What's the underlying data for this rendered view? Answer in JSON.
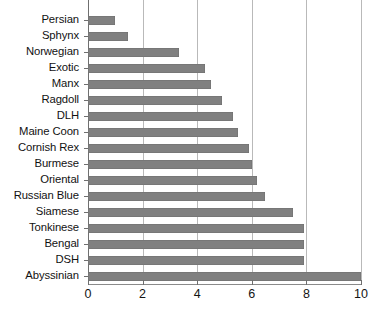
{
  "chart_data": {
    "type": "bar",
    "orientation": "horizontal",
    "title": "",
    "subtitle": "",
    "xlabel": "",
    "ylabel": "",
    "xlim": [
      0,
      10
    ],
    "ylim": null,
    "grid": true,
    "grid_axis": "x",
    "legend": false,
    "legend_position": "none",
    "bar_color": "#808080",
    "gridline_color": "#b9b9b9",
    "axis_color": "#8a8a8a",
    "xticks": [
      0,
      2,
      4,
      6,
      8,
      10
    ],
    "xtick_labels": [
      "0",
      "2",
      "4",
      "6",
      "8",
      "10"
    ],
    "categories": [
      "Persian",
      "Sphynx",
      "Norwegian",
      "Exotic",
      "Manx",
      "Ragdoll",
      "DLH",
      "Maine Coon",
      "Cornish Rex",
      "Burmese",
      "Oriental",
      "Russian Blue",
      "Siamese",
      "Tonkinese",
      "Bengal",
      "DSH",
      "Abyssinian"
    ],
    "values": [
      1.0,
      1.45,
      3.35,
      4.3,
      4.5,
      4.9,
      5.3,
      5.5,
      5.9,
      6.0,
      6.2,
      6.5,
      7.5,
      7.9,
      7.9,
      7.9,
      10.2
    ],
    "series": [
      {
        "name": "count",
        "values": [
          1.0,
          1.45,
          3.35,
          4.3,
          4.5,
          4.9,
          5.3,
          5.5,
          5.9,
          6.0,
          6.2,
          6.5,
          7.5,
          7.9,
          7.9,
          7.9,
          10.2
        ]
      }
    ],
    "annotations": []
  }
}
